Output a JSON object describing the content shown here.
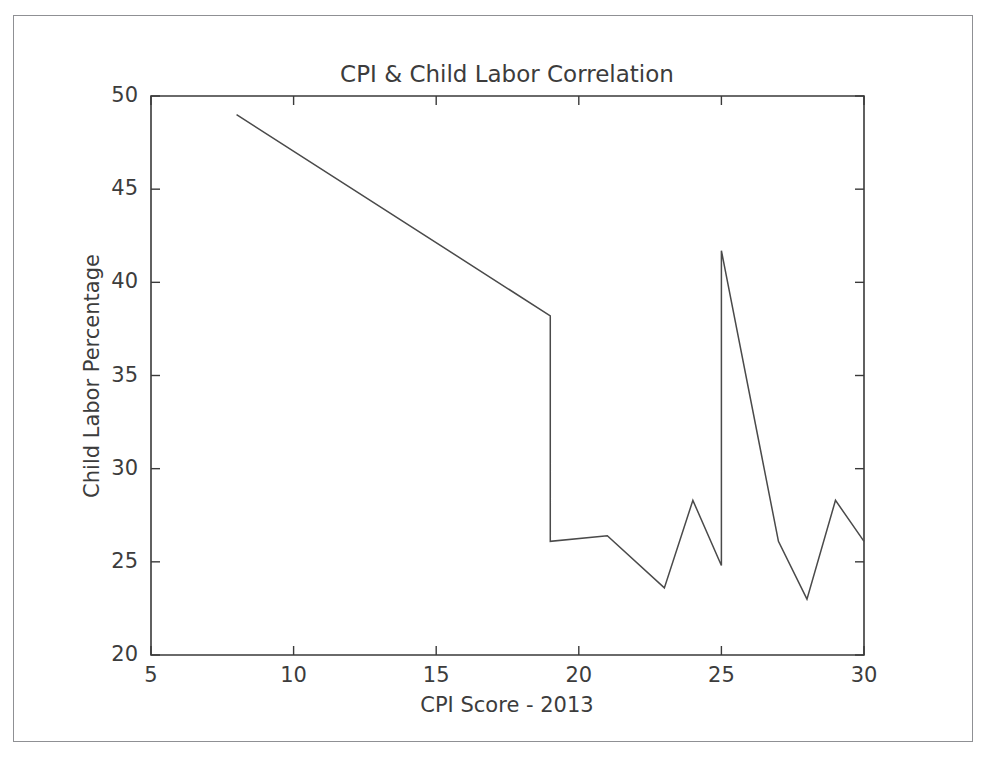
{
  "figure": {
    "background_color": "#ffffff",
    "frame_color": "#8f9094",
    "line_color": "#4a4a4a",
    "axis_color": "#3a3a3a",
    "text_color": "#3c3c3c"
  },
  "chart_data": {
    "type": "line",
    "title": "CPI & Child Labor Correlation",
    "xlabel": "CPI Score - 2013",
    "ylabel": "Child Labor Percentage",
    "xlim": [
      5,
      30
    ],
    "ylim": [
      20,
      50
    ],
    "xticks": [
      5,
      10,
      15,
      20,
      25,
      30
    ],
    "yticks": [
      20,
      25,
      30,
      35,
      40,
      45,
      50
    ],
    "xtick_labels": [
      "5",
      "10",
      "15",
      "20",
      "25",
      "30"
    ],
    "ytick_labels": [
      "20",
      "25",
      "30",
      "35",
      "40",
      "45",
      "50"
    ],
    "grid": false,
    "legend": null,
    "series": [
      {
        "name": "Child Labor Percentage",
        "color": "#4a4a4a",
        "x": [
          8,
          19,
          19,
          21,
          23,
          24,
          25,
          25,
          27,
          28,
          29,
          30
        ],
        "y": [
          49.0,
          38.2,
          26.1,
          26.4,
          23.6,
          28.3,
          24.8,
          41.7,
          26.1,
          23.0,
          28.3,
          26.1
        ]
      }
    ]
  }
}
